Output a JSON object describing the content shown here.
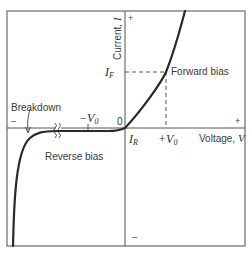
{
  "figure": {
    "axes": {
      "y_label_text": "Current, ",
      "y_label_var": "I",
      "x_label_text": "Voltage, ",
      "x_label_var": "V",
      "origin_label": "0",
      "y_positive_sign": "+",
      "y_negative_sign": "–",
      "x_positive_sign": "+",
      "x_negative_sign": "–"
    },
    "marks": {
      "i_f_main": "I",
      "i_f_sub": "F",
      "i_r_main": "I",
      "i_r_sub": "R",
      "plus_v0_prefix": "+V",
      "plus_v0_sub": "0",
      "minus_v0_prefix": "−V",
      "minus_v0_sub": "0"
    },
    "regions": {
      "forward": "Forward bias",
      "reverse": "Reverse bias",
      "breakdown": "Breakdown"
    },
    "colors": {
      "frame": "#6a6a6a",
      "axis": "#555555",
      "curve": "#2a2a2a",
      "dashed": "#555555",
      "background": "#ffffff"
    }
  }
}
